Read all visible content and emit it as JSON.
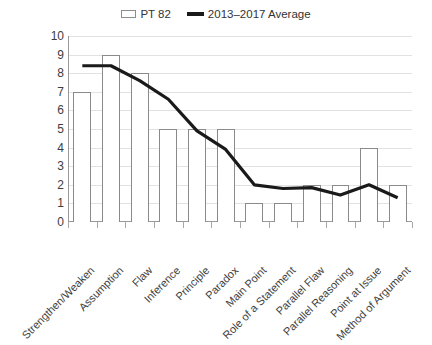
{
  "chart_data": {
    "type": "bar",
    "title": "",
    "subtitle": "",
    "xlabel": "",
    "ylabel": "",
    "ylim": [
      0,
      10
    ],
    "y_ticks": [
      0,
      1,
      2,
      3,
      4,
      5,
      6,
      7,
      8,
      9,
      10
    ],
    "grid": true,
    "legend_position": "top-center",
    "categories": [
      "Strengthen/Weaken",
      "Assumption",
      "Flaw",
      "Inference",
      "Principle",
      "Paradox",
      "Main Point",
      "Role of a Statement",
      "Parallel Flaw",
      "Parallel Reasoning",
      "Point at Issue",
      "Method of Argument"
    ],
    "series": [
      {
        "name": "PT 82",
        "type": "bar",
        "color": "#ffffff",
        "border_color": "#8a8a8a",
        "values": [
          7,
          9,
          8,
          5,
          5,
          5,
          1,
          1,
          2,
          2,
          4,
          2
        ]
      },
      {
        "name": "2013–2017 Average",
        "type": "line",
        "color": "#1a1a1a",
        "values": [
          8.4,
          8.4,
          7.6,
          6.6,
          4.9,
          3.9,
          2.0,
          1.8,
          1.85,
          1.45,
          2.0,
          1.3
        ]
      }
    ]
  },
  "legend": {
    "entries": [
      {
        "label": "PT 82",
        "marker": "bar-swatch-icon"
      },
      {
        "label": "2013–2017 Average",
        "marker": "line-swatch-icon"
      }
    ]
  },
  "axes": {
    "y_tick_labels": [
      "10",
      "9",
      "8",
      "7",
      "6",
      "5",
      "4",
      "3",
      "2",
      "1",
      "0"
    ]
  }
}
